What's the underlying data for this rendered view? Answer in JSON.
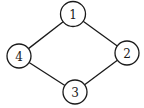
{
  "graph": {
    "stroke_color": "#1a1a1a",
    "background": "#ffffff",
    "nodes": [
      {
        "id": "1",
        "label": "1",
        "x": 73,
        "y": 14,
        "r": 12.5
      },
      {
        "id": "2",
        "label": "2",
        "x": 127,
        "y": 53,
        "r": 12
      },
      {
        "id": "3",
        "label": "3",
        "x": 75,
        "y": 92,
        "r": 12
      },
      {
        "id": "4",
        "label": "4",
        "x": 19,
        "y": 56,
        "r": 12
      }
    ],
    "edges": [
      {
        "from": "1",
        "to": "2"
      },
      {
        "from": "2",
        "to": "3"
      },
      {
        "from": "3",
        "to": "4"
      },
      {
        "from": "4",
        "to": "1"
      }
    ]
  }
}
